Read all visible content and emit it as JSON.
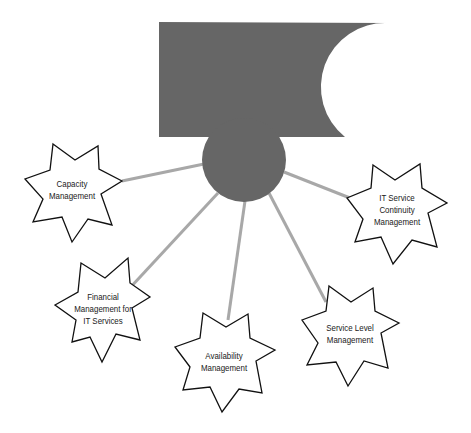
{
  "diagram": {
    "colors": {
      "hub": "#666666",
      "connector": "#a8a8a8",
      "star_stroke": "#111111",
      "star_fill": "#ffffff",
      "background": "#ffffff"
    },
    "hub": {
      "banner_shape": "rectangle-with-concave-right-edge",
      "circle_center": [
        244,
        160
      ],
      "circle_radius": 42
    },
    "nodes": [
      {
        "id": "capacity",
        "lines": [
          "Capacity",
          "Management"
        ],
        "center": [
          72,
          190
        ]
      },
      {
        "id": "it-service-continuity",
        "lines": [
          "IT Service",
          "Continuity",
          "Management"
        ],
        "center": [
          397,
          210
        ]
      },
      {
        "id": "financial",
        "lines": [
          "Financial",
          "Management for",
          "IT Services"
        ],
        "center": [
          103,
          309
        ]
      },
      {
        "id": "availability",
        "lines": [
          "Availability",
          "Management"
        ],
        "center": [
          224,
          362
        ]
      },
      {
        "id": "service-level",
        "lines": [
          "Service Level",
          "Management"
        ],
        "center": [
          350,
          334
        ]
      }
    ]
  }
}
